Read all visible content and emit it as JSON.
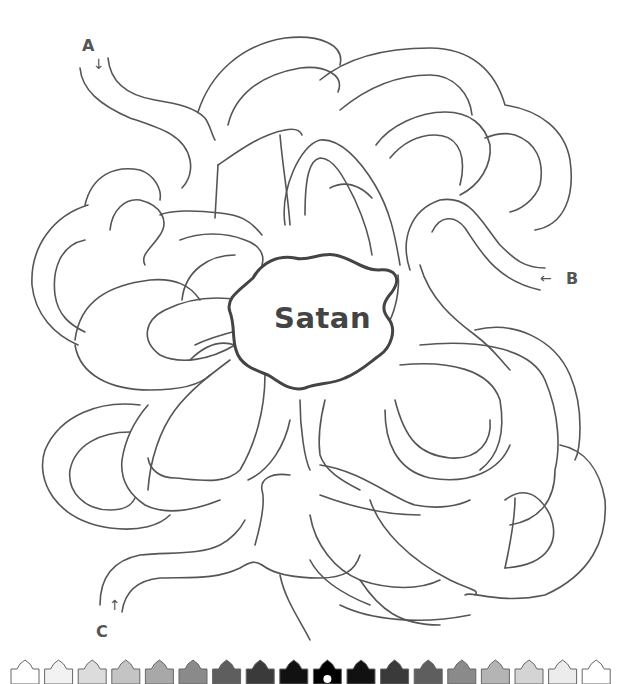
{
  "page": {
    "type": "maze-puzzle",
    "center_label": "Satan",
    "entrances": [
      {
        "id": "A",
        "label": "A",
        "arrow": "down-arrow"
      },
      {
        "id": "B",
        "label": "B",
        "arrow": "left-arrow"
      },
      {
        "id": "C",
        "label": "C",
        "arrow": "up-arrow"
      }
    ],
    "arrows": {
      "a": "↓",
      "b": "←",
      "c": "↑"
    }
  },
  "footer_strip": {
    "tile_count": 18,
    "tile_shades": [
      "#ffffff",
      "#f2f2f2",
      "#dcdcdc",
      "#c4c4c4",
      "#a8a8a8",
      "#8a8a8a",
      "#5e5e5e",
      "#3a3a3a",
      "#111111",
      "#000000",
      "#111111",
      "#3a3a3a",
      "#5e5e5e",
      "#8a8a8a",
      "#b4b4b4",
      "#d4d4d4",
      "#ececec",
      "#ffffff"
    ],
    "center_marker": "white-circle"
  },
  "colors": {
    "line": "#555555",
    "blob_outline": "#444444",
    "background": "#ffffff"
  }
}
